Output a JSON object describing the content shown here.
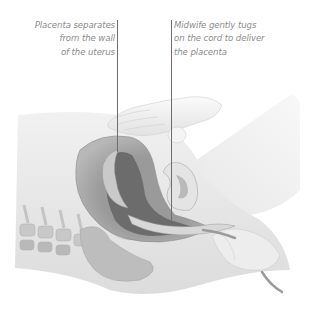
{
  "figure": {
    "style": "grayscale",
    "colors": {
      "background": "#ffffff",
      "label_text": "#8c8c8c",
      "leader_line": "#6e6e6e",
      "skin_light": "#ececec",
      "skin_mid": "#dadada",
      "uterus_wall": "#a4a4a4",
      "uterus_cavity": "#6f6f6f",
      "bone": "#c2c2c2"
    }
  },
  "callouts": [
    {
      "id": "placenta-separates",
      "lines": [
        "Placenta separates",
        "from the wall",
        "of the uterus"
      ],
      "align": "right",
      "leader": {
        "x": 117,
        "y_start": 20,
        "y_end": 152
      }
    },
    {
      "id": "midwife-tugs-cord",
      "lines": [
        "Midwife gently tugs",
        "on the cord to deliver",
        "the placenta"
      ],
      "align": "left",
      "leader": {
        "x": 171,
        "y_start": 20,
        "y_end": 223
      }
    }
  ]
}
